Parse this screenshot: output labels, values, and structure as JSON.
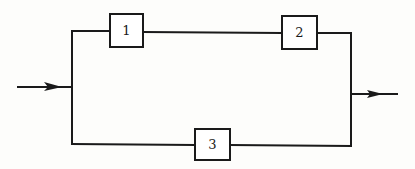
{
  "diagram": {
    "type": "reliability-block-diagram",
    "colors": {
      "line": "#1a1a1a",
      "background": "#fdfdfb"
    },
    "input": {
      "label": "",
      "direction": "right"
    },
    "output": {
      "label": "",
      "direction": "right"
    },
    "blocks": [
      {
        "id": "1",
        "label": "1",
        "branch": "upper",
        "position": 1
      },
      {
        "id": "2",
        "label": "2",
        "branch": "upper",
        "position": 2
      },
      {
        "id": "3",
        "label": "3",
        "branch": "lower",
        "position": 1
      }
    ],
    "connections": [
      {
        "from": "input",
        "to": "1"
      },
      {
        "from": "1",
        "to": "2"
      },
      {
        "from": "2",
        "to": "output"
      },
      {
        "from": "input",
        "to": "3"
      },
      {
        "from": "3",
        "to": "output"
      }
    ]
  }
}
